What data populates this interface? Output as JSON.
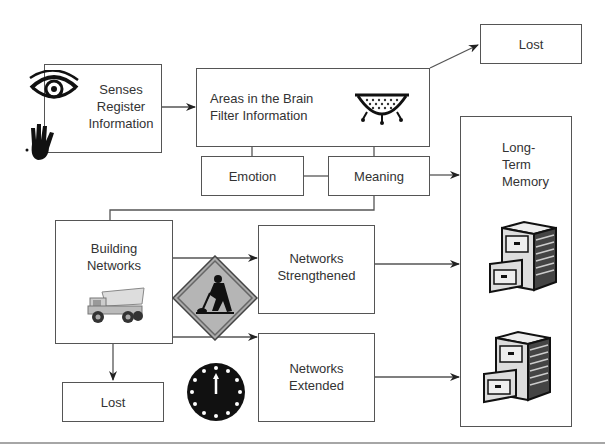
{
  "diagram": {
    "nodes": {
      "senses": {
        "label_lines": [
          "Senses",
          "Register",
          "Information"
        ]
      },
      "filter": {
        "label_lines": [
          "Areas in the Brain",
          "Filter Information"
        ]
      },
      "lost_top": {
        "label": "Lost"
      },
      "emotion": {
        "label": "Emotion"
      },
      "meaning": {
        "label": "Meaning"
      },
      "long_term": {
        "label_lines": [
          "Long-",
          "Term",
          "Memory"
        ]
      },
      "building": {
        "label_lines": [
          "Building",
          "Networks"
        ]
      },
      "strengthened": {
        "label_lines": [
          "Networks",
          "Strengthened"
        ]
      },
      "extended": {
        "label_lines": [
          "Networks",
          "Extended"
        ]
      },
      "lost_bottom": {
        "label": "Lost"
      }
    },
    "icons": [
      "eye-icon",
      "hand-icon",
      "colander-icon",
      "dump-truck-icon",
      "construction-worker-sign-icon",
      "clock-icon",
      "filing-cabinet-icon",
      "filing-cabinet-icon"
    ],
    "edges": [
      {
        "from": "senses",
        "to": "filter"
      },
      {
        "from": "filter",
        "to": "lost_top"
      },
      {
        "from": "filter",
        "to": "emotion"
      },
      {
        "from": "filter",
        "to": "meaning"
      },
      {
        "from": "emotion",
        "to": "meaning"
      },
      {
        "from": "meaning",
        "to": "long_term"
      },
      {
        "from": "meaning",
        "to": "building"
      },
      {
        "from": "building",
        "to": "strengthened"
      },
      {
        "from": "building",
        "to": "extended"
      },
      {
        "from": "building",
        "to": "lost_bottom"
      },
      {
        "from": "strengthened",
        "to": "long_term"
      },
      {
        "from": "extended",
        "to": "long_term"
      }
    ]
  }
}
